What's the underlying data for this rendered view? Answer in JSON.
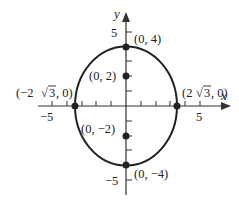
{
  "diagram": {
    "type": "ellipse",
    "equation_hint": "x^2/12 + y^2/16 = 1",
    "axes": {
      "x_label": "x",
      "y_label": "y",
      "x_ticks": [
        -5,
        -4,
        -3,
        -2,
        -1,
        1,
        2,
        3,
        4,
        5
      ],
      "y_ticks": [
        -5,
        -4,
        -3,
        -2,
        -1,
        1,
        2,
        3,
        4,
        5
      ],
      "x_tick_labels": {
        "neg5": "−5",
        "pos5": "5"
      },
      "y_tick_labels": {
        "pos5": "5",
        "neg5": "−5"
      }
    },
    "points": {
      "top_vertex": {
        "x": 0,
        "y": 4,
        "label": "(0, 4)"
      },
      "bottom_vertex": {
        "x": 0,
        "y": -4,
        "label": "(0, −4)"
      },
      "focus_top": {
        "x": 0,
        "y": 2,
        "label": "(0, 2)"
      },
      "focus_bottom": {
        "x": 0,
        "y": -2,
        "label": "(0, −2)"
      },
      "left_covertex": {
        "x": -3.464,
        "y": 0,
        "label_prefix": "(−2",
        "label_root": "3",
        "label_suffix": ", 0)"
      },
      "right_covertex": {
        "x": 3.464,
        "y": 0,
        "label_prefix": "(2",
        "label_root": "3",
        "label_suffix": ", 0)"
      }
    },
    "colors": {
      "stroke": "#222222",
      "background": "#ffffff"
    }
  }
}
